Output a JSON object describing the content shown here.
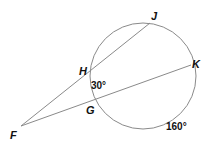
{
  "diagram": {
    "type": "circle-secants",
    "circle": {
      "cx": 143,
      "cy": 76,
      "r": 53,
      "stroke": "#8a8a8a"
    },
    "points": {
      "F": {
        "label": "F",
        "x": 21,
        "y": 126
      },
      "H": {
        "label": "H",
        "x": 91,
        "y": 70
      },
      "J": {
        "label": "J",
        "x": 150,
        "y": 23
      },
      "G": {
        "label": "G",
        "x": 96,
        "y": 99
      },
      "K": {
        "label": "K",
        "x": 191,
        "y": 65
      }
    },
    "segments": [
      {
        "from": "F",
        "to": "J"
      },
      {
        "from": "F",
        "to": "K"
      }
    ],
    "arcs": [
      {
        "between": "HG",
        "measure": "30°"
      },
      {
        "between": "GK",
        "measure": "160°"
      }
    ]
  }
}
